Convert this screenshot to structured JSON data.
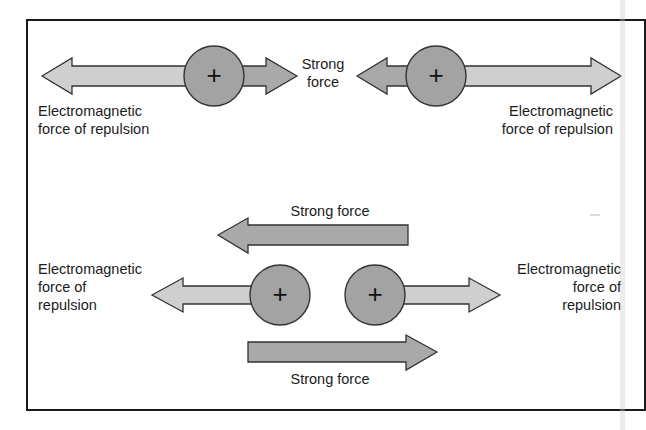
{
  "diagram": {
    "colors": {
      "background": "#ffffff",
      "frame": "#1a1a1a",
      "em_arrow_fill": "#cfcfcf",
      "strong_arrow_fill": "#a9a9a9",
      "proton_fill": "#a3a3a3",
      "outline": "#333333"
    },
    "top_row": {
      "left_label_line1": "Electromagnetic",
      "left_label_line2": "force of repulsion",
      "center_label_line1": "Strong",
      "center_label_line2": "force",
      "right_label_line1": "Electromagnetic",
      "right_label_line2": "force of repulsion",
      "proton_left_symbol": "+",
      "proton_right_symbol": "+"
    },
    "bottom_row": {
      "strong_top_label": "Strong force",
      "strong_bottom_label": "Strong force",
      "left_label_line1": "Electromagnetic",
      "left_label_line2": "force of",
      "left_label_line3": "repulsion",
      "right_label_line1": "Electromagnetic",
      "right_label_line2": "force of",
      "right_label_line3": "repulsion",
      "proton_left_symbol": "+",
      "proton_right_symbol": "+"
    }
  }
}
